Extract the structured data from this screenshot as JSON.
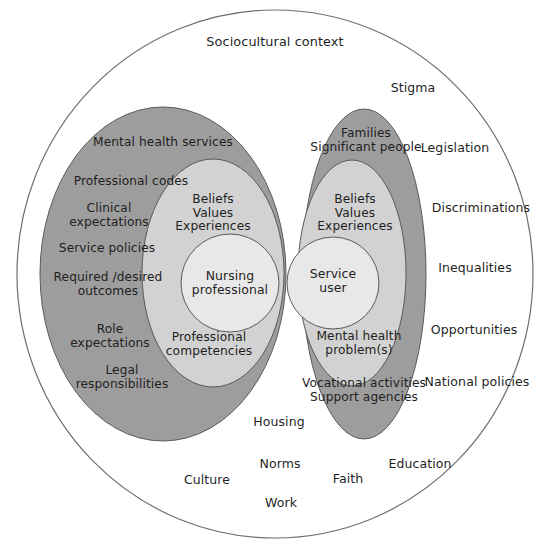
{
  "diagram": {
    "title": "Sociocultural context",
    "colors": {
      "background": "#ffffff",
      "outer_circle_fill": "#ffffff",
      "outer_circle_stroke": "#6e6e6e",
      "outer_ellipse_fill": "#9d9d9d",
      "middle_ellipse_fill": "#d2d2d2",
      "inner_circle_fill": "#e8e8e8",
      "shape_stroke": "#5a5a5a",
      "text": "#1f1f1f"
    },
    "outer_context_labels": [
      {
        "text": "Stigma",
        "x": 413,
        "y": 88
      },
      {
        "text": "Legislation",
        "x": 455,
        "y": 148
      },
      {
        "text": "Discriminations",
        "x": 481,
        "y": 208
      },
      {
        "text": "Inequalities",
        "x": 475,
        "y": 268
      },
      {
        "text": "Opportunities",
        "x": 474,
        "y": 330
      },
      {
        "text": "National policies",
        "x": 477,
        "y": 382
      },
      {
        "text": "Housing",
        "x": 279,
        "y": 422
      },
      {
        "text": "Norms",
        "x": 280,
        "y": 464
      },
      {
        "text": "Education",
        "x": 420,
        "y": 464
      },
      {
        "text": "Culture",
        "x": 207,
        "y": 480
      },
      {
        "text": "Faith",
        "x": 348,
        "y": 479
      },
      {
        "text": "Work",
        "x": 281,
        "y": 503
      }
    ],
    "left_group": {
      "name": "Nursing professional",
      "core_label": "Nursing\nprofessional",
      "middle_top_label": "Beliefs\nValues\nExperiences",
      "middle_bottom_label": "Professional\ncompetencies",
      "outer_labels": [
        {
          "text": "Mental health services",
          "x": 163,
          "y": 143
        },
        {
          "text": "Professional codes",
          "x": 131,
          "y": 182
        },
        {
          "text": "Clinical\nexpectations",
          "x": 109,
          "y": 216
        },
        {
          "text": "Service policies",
          "x": 107,
          "y": 249
        },
        {
          "text": "Required /desired\noutcomes",
          "x": 108,
          "y": 285
        },
        {
          "text": "Role\nexpectations",
          "x": 110,
          "y": 337
        },
        {
          "text": "Legal\nresponsibilities",
          "x": 122,
          "y": 378
        }
      ]
    },
    "right_group": {
      "name": "Service user",
      "core_label": "Service\nuser",
      "middle_top_label": "Beliefs\nValues\nExperiences",
      "middle_bottom_label": "Mental health\nproblem(s)",
      "outer_labels": [
        {
          "text": "Families\nSignificant people",
          "x": 366,
          "y": 141
        },
        {
          "text": "Vocational activities\nSupport agencies",
          "x": 364,
          "y": 391
        }
      ]
    },
    "geometry": {
      "outer_circle": {
        "cx": 275,
        "cy": 274,
        "rx": 258,
        "ry": 264
      },
      "left_outer": {
        "cx": 163,
        "cy": 274,
        "rx": 123,
        "ry": 167
      },
      "left_middle": {
        "cx": 213,
        "cy": 273,
        "rx": 71,
        "ry": 114
      },
      "left_core": {
        "cx": 230,
        "cy": 283,
        "rx": 49,
        "ry": 49
      },
      "right_outer": {
        "cx": 364,
        "cy": 274,
        "rx": 62,
        "ry": 165
      },
      "right_middle": {
        "cx": 352,
        "cy": 273,
        "rx": 54,
        "ry": 113
      },
      "right_core": {
        "cx": 333,
        "cy": 283,
        "rx": 46,
        "ry": 46
      }
    }
  }
}
